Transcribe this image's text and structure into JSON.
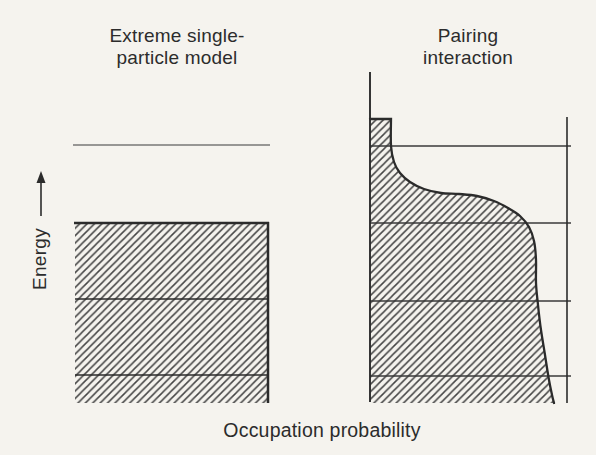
{
  "figure": {
    "titles": {
      "left_line1": "Extreme single-",
      "left_line2": "particle model",
      "right_line1": "Pairing",
      "right_line2": "interaction"
    },
    "axes": {
      "y_label": "Energy",
      "x_label": "Occupation probability"
    }
  },
  "colors": {
    "paper": "#f5f3ee",
    "ink": "#2b2b2b",
    "thin_line": "#3a3a3a",
    "hatch": "#454545"
  },
  "chart_data": {
    "type": "area",
    "xlabel": "Occupation probability",
    "ylabel": "Energy",
    "grid": false,
    "legend": "none",
    "left_panel": {
      "name": "Extreme single-particle model",
      "occupation_below_fermi": 1,
      "occupation_above_fermi": 0,
      "occupied_rect": {
        "x1": 75,
        "x2": 268,
        "y_top": 223,
        "y_bottom": 403
      },
      "inner_level_lines_y": [
        299,
        375
      ],
      "empty_level_line": {
        "y": 145,
        "x1": 73,
        "x2": 270
      }
    },
    "right_panel": {
      "name": "Pairing interaction",
      "axis_x": 370,
      "axis_y_top": 72,
      "axis_y_bottom": 402,
      "unit_line_x": 567,
      "unit_line_y_top": 117,
      "unit_line_y_bottom": 403,
      "level_lines_y": [
        146,
        223,
        301,
        376
      ],
      "level_line_x2": 571,
      "region_top_y": 119,
      "region_bottom_y": 403,
      "curve_points": [
        [
          391,
          119
        ],
        [
          391,
          146
        ],
        [
          394,
          162
        ],
        [
          400,
          173
        ],
        [
          410,
          182
        ],
        [
          424,
          189
        ],
        [
          441,
          193
        ],
        [
          459,
          194
        ],
        [
          477,
          196
        ],
        [
          494,
          201
        ],
        [
          508,
          208
        ],
        [
          520,
          216
        ],
        [
          529,
          227
        ],
        [
          534,
          241
        ],
        [
          536,
          260
        ],
        [
          536,
          283
        ],
        [
          538,
          305
        ],
        [
          541,
          330
        ],
        [
          545,
          355
        ],
        [
          549,
          380
        ],
        [
          552,
          395
        ],
        [
          554,
          403
        ]
      ]
    },
    "energy_arrow": {
      "x": 41,
      "y_tip": 171,
      "y_base": 216,
      "head_half_width": 4.5,
      "head_length": 12
    },
    "hatch": {
      "spacing": 7.4,
      "stroke_width": 1.5,
      "angle": "45deg-forward-slash"
    }
  }
}
